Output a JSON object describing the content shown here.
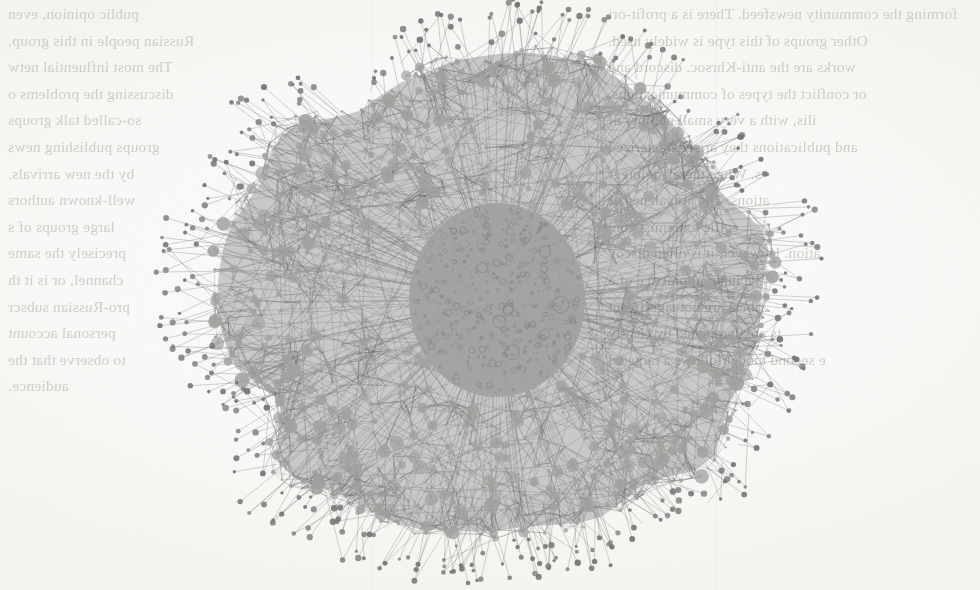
{
  "page": {
    "width": 980,
    "height": 590,
    "media": "scanned book page",
    "paper_color": "#fbfbfa"
  },
  "bleedthrough_text": {
    "note": "Mirror-reversed text bleeding through from the verso of the scanned leaf; rendered reversed and very faint.",
    "color": "#c9c9c6",
    "left_column_lines": [
      "public opinion, even",
      "Russian people in this group.",
      "The most influential netw",
      "discussing the problems o",
      "so-called talk groups",
      "groups publishing news",
      "by the new arrivals.",
      "well-known authors",
      "large groups of s",
      "precisely the same",
      "channel, or is it th",
      "pro-Russian subscr",
      "personal account",
      "to observe that the",
      "audience."
    ],
    "right_column_lines": [
      "forming the community newsfeed. There is a profit-ori",
      "Other groups of this type is widely used.",
      "works are the anti-Khrsoc. discord and",
      "or conflict the types of communications.",
      "ilis, with a very small number of",
      "and publications they are characterized",
      "s. When there are integr",
      "ations. The prevalence of",
      "ecific extremist com",
      "ation. However, it is often discov",
      "he internal practice of a",
      "ribers are not significant",
      "ts are dominated by clearly",
      "e second model follows a targeted"
    ]
  },
  "figure": {
    "type": "network-graph",
    "layout": "radial / force-directed hairball",
    "center_x": 500,
    "center_y": 297,
    "radius_x": 290,
    "radius_y": 258,
    "core": {
      "label": "dense light core cluster",
      "center_x": 497,
      "center_y": 300,
      "radius_x": 88,
      "radius_y": 97,
      "fill": "#9b9b99",
      "node_ring_color": "#7a7a78",
      "node_count_estimate": 210
    },
    "mesh": {
      "label": "dark edge mesh annulus",
      "edge_color": "#5a5a5a",
      "node_color": "#9a9a98",
      "fill_darkness": "#515151",
      "edge_count_estimate": 9000,
      "node_count_estimate": 1400
    },
    "periphery": {
      "label": "outer fringe of low-degree nodes on spokes",
      "node_color": "#6d6d6d",
      "spoke_color": "#6b6b6b",
      "node_count_estimate": 320
    },
    "palette": {
      "paper": "#fbfbfa",
      "mesh_dark": "#515151",
      "edge": "#5a5a5a",
      "node_light": "#9a9a98",
      "node_dark": "#6d6d6d",
      "core_fill": "#9b9b99",
      "bleed_text": "#c9c9c6"
    }
  },
  "chart_data": {
    "type": "scatter",
    "title": "",
    "xlabel": "",
    "ylabel": "",
    "note": "Node-link diagram; node radius encodes degree/size, position is a radial embedding. No axes, ticks, legend or annotations are printed in the figure.",
    "rings": [
      {
        "name": "core",
        "radius_frac": 0.0,
        "node_count": 210,
        "node_size_px": [
          1.2,
          4.5
        ],
        "tone": "light"
      },
      {
        "name": "inner-mesh",
        "radius_frac": 0.35,
        "node_count": 520,
        "node_size_px": [
          1.4,
          6.5
        ],
        "tone": "light-on-dark"
      },
      {
        "name": "outer-mesh",
        "radius_frac": 0.7,
        "node_count": 880,
        "node_size_px": [
          1.2,
          7.5
        ],
        "tone": "light-on-dark"
      },
      {
        "name": "fringe",
        "radius_frac": 1.0,
        "node_count": 320,
        "node_size_px": [
          1.6,
          3.2
        ],
        "tone": "dark"
      }
    ],
    "legend": [],
    "grid": false
  }
}
